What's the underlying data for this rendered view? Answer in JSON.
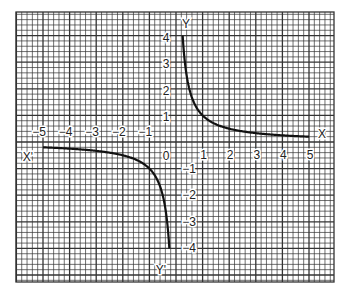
{
  "chart_data": {
    "type": "line",
    "title": "",
    "function": "y = 1/x",
    "xlabel": "X",
    "xlabel_neg": "X'",
    "ylabel": "Y",
    "ylabel_neg": "Y'",
    "origin_label": "0",
    "xlim": [
      -5.9,
      5.9
    ],
    "ylim": [
      -5.2,
      5.2
    ],
    "grid": true,
    "minor_per_unit": 5,
    "x_ticks": [
      "-5",
      "-4",
      "-3",
      "-2",
      "-1",
      "1",
      "2",
      "3",
      "4",
      "5"
    ],
    "y_ticks": [
      "4",
      "3",
      "2",
      "1",
      "-1",
      "-2",
      "-3",
      "-4"
    ],
    "series": [
      {
        "name": "upper branch",
        "x": [
          0.25,
          0.3,
          0.4,
          0.5,
          0.75,
          1,
          1.5,
          2,
          2.5,
          3,
          3.5,
          4,
          4.5,
          5
        ],
        "y": [
          4,
          3.33,
          2.5,
          2,
          1.33,
          1,
          0.67,
          0.5,
          0.4,
          0.33,
          0.29,
          0.25,
          0.22,
          0.2
        ]
      },
      {
        "name": "lower branch",
        "x": [
          -5,
          -4.5,
          -4,
          -3.5,
          -3,
          -2.5,
          -2,
          -1.5,
          -1,
          -0.75,
          -0.5,
          -0.4,
          -0.3,
          -0.25
        ],
        "y": [
          -0.2,
          -0.22,
          -0.25,
          -0.29,
          -0.33,
          -0.4,
          -0.5,
          -0.67,
          -1,
          -1.33,
          -2,
          -2.5,
          -3.33,
          -4
        ]
      }
    ],
    "colors": {
      "grid": "#333333",
      "curve": "#111111",
      "background": "#ffffff"
    }
  }
}
